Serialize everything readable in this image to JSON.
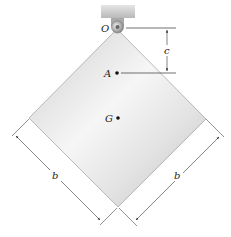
{
  "diagram": {
    "type": "mechanics-figure",
    "labels": {
      "pivot": "O",
      "point_a": "A",
      "center_of_mass": "G",
      "distance_c": "c",
      "side_left": "b",
      "side_right": "b"
    },
    "colors": {
      "plate_light": "#f4f4f4",
      "plate_mid": "#d9d9d9",
      "plate_edge": "#a8a8a8",
      "support": "#c9c9c9",
      "line": "#333333"
    }
  }
}
